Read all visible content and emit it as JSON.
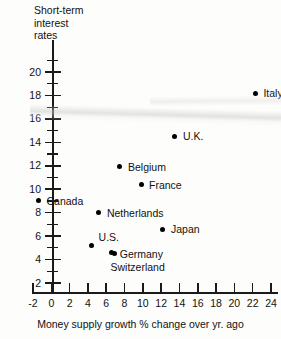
{
  "chart_data": {
    "type": "scatter",
    "title": "",
    "ylabel": "Short-term\ninterest\nrates",
    "xlabel": "Money supply growth % change over yr. ago",
    "xlim": [
      -3,
      25.5
    ],
    "ylim": [
      1,
      21.5
    ],
    "xticks": [
      -2,
      0,
      2,
      4,
      6,
      8,
      10,
      12,
      14,
      16,
      18,
      20,
      22,
      24
    ],
    "xtick_labels": [
      "-2",
      "0",
      "2",
      "4",
      "6",
      "8",
      "10",
      "12",
      "14",
      "16",
      "18",
      "20",
      "22",
      "24"
    ],
    "yticks": [
      2,
      4,
      6,
      8,
      10,
      12,
      14,
      16,
      18,
      20
    ],
    "ytick_labels": [
      "2",
      "4",
      "6",
      "8",
      "10",
      "12",
      "14",
      "16",
      "18",
      "20"
    ],
    "y_minor_ticks": [
      3,
      5,
      7,
      9,
      11,
      13,
      15,
      17,
      19,
      21
    ],
    "grid": false,
    "legend": false,
    "marker_color": "#000000",
    "points": [
      {
        "label": "Italy",
        "x": 22.3,
        "y": 18.2,
        "label_dx": 8,
        "label_dy": -5
      },
      {
        "label": "U.K.",
        "x": 13.5,
        "y": 14.5,
        "label_dx": 8,
        "label_dy": -5
      },
      {
        "label": "Belgium",
        "x": 7.5,
        "y": 11.9,
        "label_dx": 8,
        "label_dy": -5
      },
      {
        "label": "France",
        "x": 9.8,
        "y": 10.4,
        "label_dx": 8,
        "label_dy": -5
      },
      {
        "label": "Canada",
        "x": -1.4,
        "y": 9.0,
        "label_dx": 8,
        "label_dy": -5
      },
      {
        "label": "Netherlands",
        "x": 5.2,
        "y": 8.0,
        "label_dx": 8,
        "label_dy": -5
      },
      {
        "label": "Japan",
        "x": 12.2,
        "y": 6.6,
        "label_dx": 8,
        "label_dy": -5
      },
      {
        "label": "U.S.",
        "x": 4.4,
        "y": 5.2,
        "label_dx": 7,
        "label_dy": -13
      },
      {
        "label": "Germany",
        "x": 6.6,
        "y": 4.6,
        "label_dx": 8,
        "label_dy": -4
      },
      {
        "label": "Switzerland",
        "x": 6.9,
        "y": 4.5,
        "label_dx": -4,
        "label_dy": 8
      }
    ]
  }
}
